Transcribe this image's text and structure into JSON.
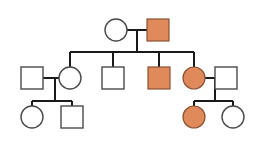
{
  "figure": {
    "kind": "pedigree-chart",
    "background_color": "#ffffff",
    "line_color": "#1a1a1a",
    "unaffected_fill": "#ffffff",
    "unaffected_stroke": "#4a4a4a",
    "affected_fill": "#e08a5c",
    "affected_stroke": "#8a5233",
    "symbol_size": 22,
    "circle_radius": 11
  },
  "generations": [
    {
      "id": "generation-1",
      "individuals": [
        {
          "id": "I-1",
          "shape": "circle",
          "sex": "female",
          "status": "unaffected",
          "cx": 116,
          "cy": 30,
          "r": 11
        },
        {
          "id": "I-2",
          "shape": "square",
          "sex": "male",
          "status": "affected",
          "x": 147,
          "y": 19,
          "size": 22
        }
      ]
    },
    {
      "id": "generation-2",
      "individuals": [
        {
          "id": "II-1",
          "shape": "square",
          "sex": "male",
          "status": "unaffected",
          "x": 21,
          "y": 67,
          "size": 22,
          "role": "spouse"
        },
        {
          "id": "II-2",
          "shape": "circle",
          "sex": "female",
          "status": "unaffected",
          "cx": 70,
          "cy": 78,
          "r": 11,
          "role": "child"
        },
        {
          "id": "II-3",
          "shape": "square",
          "sex": "male",
          "status": "unaffected",
          "x": 102,
          "y": 67,
          "size": 22,
          "role": "child"
        },
        {
          "id": "II-4",
          "shape": "square",
          "sex": "male",
          "status": "affected",
          "x": 148,
          "y": 67,
          "size": 22,
          "role": "child"
        },
        {
          "id": "II-5",
          "shape": "circle",
          "sex": "female",
          "status": "affected",
          "cx": 194,
          "cy": 78,
          "r": 11,
          "role": "child"
        },
        {
          "id": "II-6",
          "shape": "square",
          "sex": "male",
          "status": "unaffected",
          "x": 215,
          "y": 67,
          "size": 22,
          "role": "spouse"
        }
      ]
    },
    {
      "id": "generation-3",
      "individuals": [
        {
          "id": "III-1",
          "shape": "circle",
          "sex": "female",
          "status": "unaffected",
          "cx": 32,
          "cy": 117,
          "r": 11
        },
        {
          "id": "III-2",
          "shape": "square",
          "sex": "male",
          "status": "unaffected",
          "x": 61,
          "y": 106,
          "size": 22
        },
        {
          "id": "III-3",
          "shape": "circle",
          "sex": "female",
          "status": "affected",
          "cx": 194,
          "cy": 117,
          "r": 11
        },
        {
          "id": "III-4",
          "shape": "circle",
          "sex": "female",
          "status": "unaffected",
          "cx": 233,
          "cy": 117,
          "r": 11
        }
      ]
    }
  ],
  "connectors": {
    "mating_lines": [
      {
        "id": "mating-I1-I2",
        "x1": 127,
        "y1": 30,
        "x2": 147,
        "y2": 30
      },
      {
        "id": "mating-II1-II2",
        "x1": 43,
        "y1": 78,
        "x2": 59,
        "y2": 78
      },
      {
        "id": "mating-II5-II6",
        "x1": 205,
        "y1": 78,
        "x2": 215,
        "y2": 78
      }
    ],
    "descent_lines": [
      {
        "id": "descent-gen1",
        "x1": 137,
        "y1": 30,
        "x2": 137,
        "y2": 52
      },
      {
        "id": "descent-gen2-left",
        "x1": 55,
        "y1": 78,
        "x2": 55,
        "y2": 101
      },
      {
        "id": "descent-gen2-right",
        "x1": 215,
        "y1": 78,
        "x2": 215,
        "y2": 101
      }
    ],
    "sibship_bars": [
      {
        "id": "sibship-gen2",
        "x1": 70,
        "y": 52,
        "x2": 194
      },
      {
        "id": "sibship-gen3-left",
        "x1": 32,
        "y": 101,
        "x2": 72
      },
      {
        "id": "sibship-gen3-right",
        "x1": 194,
        "y": 101,
        "x2": 233
      }
    ],
    "sibling_drops": [
      {
        "id": "drop-II-2",
        "x": 70,
        "y1": 52,
        "y2": 67
      },
      {
        "id": "drop-II-3",
        "x": 113,
        "y1": 52,
        "y2": 67
      },
      {
        "id": "drop-II-4",
        "x": 159,
        "y1": 52,
        "y2": 67
      },
      {
        "id": "drop-II-5",
        "x": 194,
        "y1": 52,
        "y2": 67
      },
      {
        "id": "drop-III-1",
        "x": 32,
        "y1": 101,
        "y2": 106
      },
      {
        "id": "drop-III-2",
        "x": 72,
        "y1": 101,
        "y2": 106
      },
      {
        "id": "drop-III-3",
        "x": 194,
        "y1": 101,
        "y2": 106
      },
      {
        "id": "drop-III-4",
        "x": 233,
        "y1": 101,
        "y2": 106
      }
    ]
  }
}
